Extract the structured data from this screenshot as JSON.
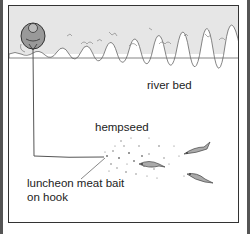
{
  "diagram": {
    "labels": {
      "river_bed": "river bed",
      "hempseed": "hempseed",
      "bait_line1": "luncheon meat bait",
      "bait_line2": "on hook"
    },
    "elements": {
      "angler": "angler-icon",
      "fishing_line": "fishing-line",
      "bank": "river-bank",
      "fish_count": 3
    },
    "colors": {
      "frame": "#333333",
      "bank": "#e6e6e6",
      "fish": "#aaaaaa",
      "text": "#222222"
    }
  }
}
